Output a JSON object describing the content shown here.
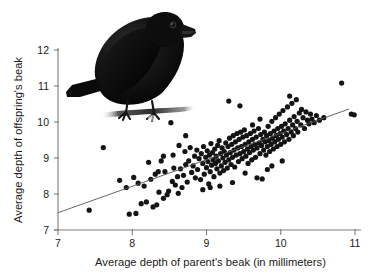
{
  "figure": {
    "background_color": "#ffffff",
    "point_color": "#141414",
    "axis_color": "#7d7d7d",
    "line_color": "#555555",
    "illustration": {
      "name": "darwins-finch-illustration",
      "description": "Dark Darwin's finch perched on a branch",
      "silhouette_color": "#0d0d0d"
    }
  },
  "chart_data": {
    "type": "scatter",
    "title": "",
    "xlabel": "Average depth of parent's beak (in millimeters)",
    "ylabel": "Average depth of offspring's beak",
    "xlim": [
      7,
      11
    ],
    "ylim": [
      7,
      12
    ],
    "xticks": [
      7,
      8,
      9,
      10,
      11
    ],
    "yticks": [
      7,
      8,
      9,
      10,
      11,
      12
    ],
    "xtick_labels": [
      "7",
      "8",
      "9",
      "10",
      "11"
    ],
    "ytick_labels": [
      "7",
      "8",
      "9",
      "10",
      "11",
      "12"
    ],
    "grid": false,
    "legend": null,
    "trend_line": {
      "type": "linear-regression",
      "x_start": 7.0,
      "y_start": 7.48,
      "x_end": 10.92,
      "y_end": 10.36,
      "slope": 0.735,
      "intercept": 2.335
    },
    "points": [
      [
        7.42,
        7.55
      ],
      [
        7.61,
        9.29
      ],
      [
        7.83,
        8.38
      ],
      [
        7.92,
        8.18
      ],
      [
        7.96,
        7.44
      ],
      [
        8.02,
        8.46
      ],
      [
        8.05,
        7.46
      ],
      [
        8.08,
        8.3
      ],
      [
        8.12,
        7.73
      ],
      [
        8.16,
        8.22
      ],
      [
        8.19,
        7.78
      ],
      [
        8.22,
        8.88
      ],
      [
        8.25,
        8.41
      ],
      [
        8.28,
        7.64
      ],
      [
        8.31,
        8.55
      ],
      [
        8.33,
        7.7
      ],
      [
        8.36,
        8.05
      ],
      [
        8.39,
        8.92
      ],
      [
        8.42,
        9.05
      ],
      [
        8.44,
        8.62
      ],
      [
        8.47,
        7.98
      ],
      [
        8.49,
        8.08
      ],
      [
        8.52,
        9.98
      ],
      [
        8.54,
        8.35
      ],
      [
        8.56,
        8.72
      ],
      [
        8.58,
        8.25
      ],
      [
        8.61,
        8.48
      ],
      [
        8.63,
        9.35
      ],
      [
        8.65,
        8.7
      ],
      [
        8.67,
        8.18
      ],
      [
        8.69,
        8.52
      ],
      [
        8.71,
        9.18
      ],
      [
        8.72,
        8.82
      ],
      [
        8.74,
        8.33
      ],
      [
        8.76,
        8.92
      ],
      [
        8.78,
        9.29
      ],
      [
        8.8,
        8.6
      ],
      [
        8.82,
        8.78
      ],
      [
        8.84,
        9.05
      ],
      [
        8.85,
        8.45
      ],
      [
        8.87,
        9.22
      ],
      [
        8.88,
        8.68
      ],
      [
        8.9,
        8.98
      ],
      [
        8.92,
        8.4
      ],
      [
        8.93,
        9.12
      ],
      [
        8.95,
        8.85
      ],
      [
        8.96,
        9.32
      ],
      [
        8.97,
        8.55
      ],
      [
        8.99,
        9.02
      ],
      [
        9.0,
        8.73
      ],
      [
        9.01,
        9.2
      ],
      [
        9.02,
        8.9
      ],
      [
        9.03,
        8.28
      ],
      [
        9.04,
        9.08
      ],
      [
        9.05,
        8.62
      ],
      [
        9.06,
        9.4
      ],
      [
        9.07,
        8.8
      ],
      [
        9.08,
        9.15
      ],
      [
        9.09,
        8.95
      ],
      [
        9.1,
        8.48
      ],
      [
        9.11,
        9.25
      ],
      [
        9.12,
        8.85
      ],
      [
        9.13,
        9.05
      ],
      [
        9.14,
        8.7
      ],
      [
        9.15,
        9.35
      ],
      [
        9.16,
        8.92
      ],
      [
        9.17,
        9.48
      ],
      [
        9.18,
        8.58
      ],
      [
        9.19,
        9.12
      ],
      [
        9.2,
        8.78
      ],
      [
        9.21,
        9.28
      ],
      [
        9.22,
        9.0
      ],
      [
        9.23,
        8.65
      ],
      [
        9.24,
        9.18
      ],
      [
        9.25,
        8.88
      ],
      [
        9.26,
        9.42
      ],
      [
        9.27,
        9.08
      ],
      [
        9.28,
        8.72
      ],
      [
        9.29,
        9.32
      ],
      [
        9.3,
        8.95
      ],
      [
        9.31,
        9.55
      ],
      [
        9.32,
        9.15
      ],
      [
        9.33,
        8.82
      ],
      [
        9.34,
        9.38
      ],
      [
        9.35,
        9.02
      ],
      [
        9.36,
        9.62
      ],
      [
        9.37,
        9.22
      ],
      [
        9.38,
        8.75
      ],
      [
        9.39,
        9.45
      ],
      [
        9.4,
        9.08
      ],
      [
        9.41,
        9.68
      ],
      [
        9.42,
        9.28
      ],
      [
        9.43,
        8.9
      ],
      [
        9.44,
        9.52
      ],
      [
        9.45,
        9.12
      ],
      [
        9.46,
        9.72
      ],
      [
        9.47,
        9.32
      ],
      [
        9.48,
        8.98
      ],
      [
        9.49,
        9.58
      ],
      [
        9.5,
        9.18
      ],
      [
        9.51,
        9.78
      ],
      [
        9.52,
        9.38
      ],
      [
        9.53,
        9.05
      ],
      [
        9.54,
        9.62
      ],
      [
        9.55,
        9.25
      ],
      [
        9.56,
        8.85
      ],
      [
        9.57,
        9.45
      ],
      [
        9.58,
        9.15
      ],
      [
        9.59,
        9.68
      ],
      [
        9.6,
        9.32
      ],
      [
        9.61,
        8.95
      ],
      [
        9.62,
        9.52
      ],
      [
        9.63,
        9.22
      ],
      [
        9.64,
        9.75
      ],
      [
        9.65,
        9.38
      ],
      [
        9.66,
        9.02
      ],
      [
        9.67,
        9.58
      ],
      [
        9.68,
        9.28
      ],
      [
        9.7,
        9.82
      ],
      [
        9.71,
        9.42
      ],
      [
        9.72,
        9.12
      ],
      [
        9.73,
        9.65
      ],
      [
        9.74,
        9.35
      ],
      [
        9.75,
        8.42
      ],
      [
        9.76,
        9.52
      ],
      [
        9.77,
        9.22
      ],
      [
        9.78,
        9.72
      ],
      [
        9.79,
        9.45
      ],
      [
        9.8,
        9.08
      ],
      [
        9.81,
        9.62
      ],
      [
        9.82,
        9.32
      ],
      [
        9.83,
        9.88
      ],
      [
        9.84,
        9.48
      ],
      [
        9.85,
        9.18
      ],
      [
        9.86,
        9.68
      ],
      [
        9.87,
        9.38
      ],
      [
        9.88,
        10.02
      ],
      [
        9.89,
        9.55
      ],
      [
        9.9,
        9.25
      ],
      [
        9.91,
        9.75
      ],
      [
        9.92,
        9.45
      ],
      [
        9.93,
        10.12
      ],
      [
        9.94,
        9.62
      ],
      [
        9.95,
        9.32
      ],
      [
        9.96,
        9.82
      ],
      [
        9.97,
        9.52
      ],
      [
        9.98,
        10.22
      ],
      [
        9.99,
        9.68
      ],
      [
        10.0,
        9.38
      ],
      [
        10.01,
        9.88
      ],
      [
        10.02,
        9.58
      ],
      [
        10.03,
        10.32
      ],
      [
        10.04,
        9.75
      ],
      [
        10.05,
        9.45
      ],
      [
        10.06,
        9.95
      ],
      [
        10.08,
        9.65
      ],
      [
        10.09,
        10.42
      ],
      [
        10.1,
        9.82
      ],
      [
        10.11,
        9.52
      ],
      [
        10.12,
        10.05
      ],
      [
        10.14,
        9.72
      ],
      [
        10.15,
        10.52
      ],
      [
        10.16,
        9.92
      ],
      [
        10.17,
        9.62
      ],
      [
        10.18,
        10.15
      ],
      [
        10.2,
        9.82
      ],
      [
        10.21,
        10.62
      ],
      [
        10.22,
        10.02
      ],
      [
        10.23,
        9.72
      ],
      [
        10.25,
        10.25
      ],
      [
        10.27,
        9.92
      ],
      [
        10.28,
        10.35
      ],
      [
        10.3,
        10.12
      ],
      [
        10.32,
        9.82
      ],
      [
        10.34,
        10.28
      ],
      [
        10.36,
        10.05
      ],
      [
        10.38,
        9.95
      ],
      [
        10.4,
        10.22
      ],
      [
        10.42,
        10.08
      ],
      [
        10.45,
        9.98
      ],
      [
        10.48,
        10.18
      ],
      [
        10.52,
        10.05
      ],
      [
        10.58,
        10.12
      ],
      [
        10.82,
        11.08
      ],
      [
        10.95,
        10.22
      ],
      [
        10.99,
        10.2
      ],
      [
        9.3,
        10.58
      ],
      [
        9.45,
        10.45
      ],
      [
        10.12,
        10.72
      ],
      [
        8.72,
        9.62
      ],
      [
        8.55,
        9.08
      ],
      [
        9.05,
        8.18
      ],
      [
        9.18,
        8.22
      ],
      [
        9.35,
        8.32
      ],
      [
        9.52,
        8.58
      ],
      [
        9.68,
        8.45
      ],
      [
        9.82,
        8.68
      ],
      [
        10.02,
        8.92
      ],
      [
        9.88,
        8.78
      ],
      [
        8.95,
        8.12
      ],
      [
        8.62,
        8.02
      ],
      [
        8.42,
        7.88
      ],
      [
        8.35,
        8.62
      ],
      [
        9.62,
        9.92
      ],
      [
        9.72,
        10.08
      ]
    ]
  }
}
